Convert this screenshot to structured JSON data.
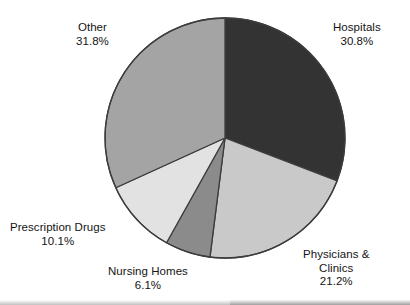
{
  "chart_data": {
    "type": "pie",
    "title": "",
    "subtitle": "",
    "xlabel": "",
    "ylabel": "",
    "legend_position": "none",
    "labels_position": "outside",
    "grid": false,
    "start_angle_deg": 0,
    "direction": "clockwise",
    "center": {
      "x": 225,
      "y": 138
    },
    "radius": 120,
    "categories": [
      "Hospitals",
      "Physicians & Clinics",
      "Nursing Homes",
      "Prescription Drugs",
      "Other"
    ],
    "values": [
      30.8,
      21.2,
      6.1,
      10.1,
      31.8
    ],
    "unit": "%",
    "colors": [
      "#333333",
      "#c9c9c9",
      "#8b8b8b",
      "#e2e2e2",
      "#a4a4a4"
    ],
    "slices": [
      {
        "label": "Hospitals",
        "value": 30.8,
        "value_text": "30.8%",
        "color": "#333333",
        "start_deg": 0.0,
        "end_deg": 110.88
      },
      {
        "label": "Physicians & Clinics",
        "label_line1": "Physicians &",
        "label_line2": "Clinics",
        "value": 21.2,
        "value_text": "21.2%",
        "color": "#c9c9c9",
        "start_deg": 110.88,
        "end_deg": 187.2
      },
      {
        "label": "Nursing Homes",
        "value": 6.1,
        "value_text": "6.1%",
        "color": "#8b8b8b",
        "start_deg": 187.2,
        "end_deg": 209.16
      },
      {
        "label": "Prescription Drugs",
        "value": 10.1,
        "value_text": "10.1%",
        "color": "#e2e2e2",
        "start_deg": 209.16,
        "end_deg": 245.52
      },
      {
        "label": "Other",
        "value": 31.8,
        "value_text": "31.8%",
        "color": "#a4a4a4",
        "start_deg": 245.52,
        "end_deg": 360.0
      }
    ]
  },
  "labels": {
    "hospitals": {
      "name": "Hospitals",
      "value": "30.8%"
    },
    "other": {
      "name": "Other",
      "value": "31.8%"
    },
    "prescription_drugs": {
      "name": "Prescription Drugs",
      "value": "10.1%"
    },
    "nursing_homes": {
      "name": "Nursing Homes",
      "value": "6.1%"
    },
    "physicians_clinics": {
      "name": "Physicians &",
      "name2": "Clinics",
      "value": "21.2%"
    }
  },
  "style": {
    "background": "#ffffff",
    "outline": "#3c3c3c",
    "text": "#141414"
  }
}
